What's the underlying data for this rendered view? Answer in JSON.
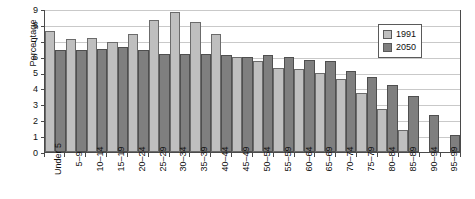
{
  "chart_data": {
    "type": "bar",
    "title": "",
    "xlabel": "",
    "ylabel": "Percentage",
    "ylim": [
      0,
      9
    ],
    "yticks": [
      0,
      1,
      2,
      3,
      4,
      5,
      6,
      7,
      8,
      9
    ],
    "grid": true,
    "legend_position": "top-right",
    "categories": [
      "Under 5",
      "5–9",
      "10–14",
      "15–19",
      "20–24",
      "25–29",
      "30–34",
      "35–39",
      "40–44",
      "45–49",
      "50–54",
      "55–59",
      "60–64",
      "65–69",
      "70–74",
      "75–79",
      "80–84",
      "85–89",
      "90–94",
      "95–99"
    ],
    "series": [
      {
        "name": "1991",
        "color": "#bfbfbf",
        "values": [
          7.6,
          7.1,
          7.2,
          6.9,
          7.4,
          8.3,
          8.8,
          8.2,
          7.4,
          6.0,
          5.7,
          5.3,
          5.2,
          5.0,
          4.6,
          3.7,
          2.7,
          1.4,
          0.05,
          0.05
        ]
      },
      {
        "name": "2050",
        "color": "#7f7f7f",
        "values": [
          6.4,
          6.4,
          6.5,
          6.6,
          6.4,
          6.2,
          6.2,
          6.2,
          6.1,
          6.0,
          6.1,
          6.0,
          5.8,
          5.7,
          5.1,
          4.7,
          4.2,
          3.5,
          2.3,
          1.1
        ]
      }
    ]
  },
  "legend": {
    "items": [
      {
        "label": "1991"
      },
      {
        "label": "2050"
      }
    ]
  }
}
